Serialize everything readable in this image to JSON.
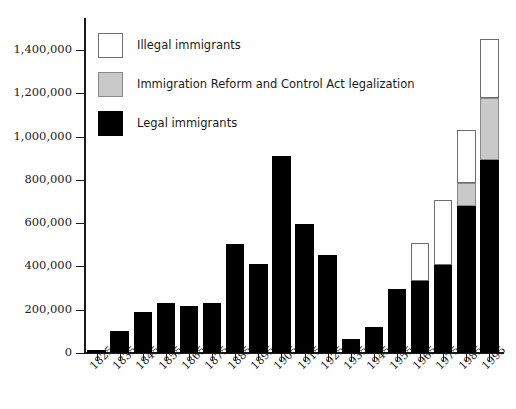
{
  "chart_data": {
    "type": "bar",
    "stacked": true,
    "title": "",
    "xlabel": "",
    "ylabel": "",
    "ylim": [
      0,
      1500000
    ],
    "grid": false,
    "legend_position": "top-left",
    "categories": [
      "1825",
      "1835",
      "1845",
      "1855",
      "1865",
      "1875",
      "1885",
      "1895",
      "1905",
      "1915",
      "1925",
      "1935",
      "1945",
      "1955",
      "1965",
      "1975",
      "1985",
      "1995"
    ],
    "ytick_labels": [
      "0",
      "200,000",
      "400,000",
      "600,000",
      "800,000",
      "1,000,000",
      "1,200,000",
      "1,400,000"
    ],
    "ytick_values": [
      0,
      200000,
      400000,
      600000,
      800000,
      1000000,
      1200000,
      1400000
    ],
    "series": [
      {
        "name": "Legal immigrants",
        "color": "#000000",
        "values": [
          15000,
          100000,
          190000,
          230000,
          215000,
          232000,
          503000,
          413000,
          911000,
          597000,
          451000,
          65000,
          122000,
          297000,
          332000,
          408000,
          677000,
          894000
        ]
      },
      {
        "name": "Immigration Reform and Control Act legalization",
        "color": "#c9c9c9",
        "values": [
          0,
          0,
          0,
          0,
          0,
          0,
          0,
          0,
          0,
          0,
          0,
          0,
          0,
          0,
          0,
          0,
          110000,
          285000
        ]
      },
      {
        "name": "Illegal immigrants",
        "color": "#ffffff",
        "values": [
          0,
          0,
          0,
          0,
          0,
          0,
          0,
          0,
          0,
          0,
          0,
          0,
          0,
          0,
          175000,
          300000,
          245000,
          270000
        ]
      }
    ],
    "totals": [
      15000,
      100000,
      190000,
      230000,
      215000,
      232000,
      503000,
      413000,
      911000,
      597000,
      451000,
      65000,
      122000,
      297000,
      507000,
      708000,
      1032000,
      1449000
    ]
  },
  "legend": {
    "items": [
      {
        "label": "Illegal immigrants",
        "swatch": "white-swatch"
      },
      {
        "label": "Immigration Reform and Control Act legalization",
        "swatch": "gray-swatch"
      },
      {
        "label": "Legal immigrants",
        "swatch": "black-swatch"
      }
    ]
  }
}
